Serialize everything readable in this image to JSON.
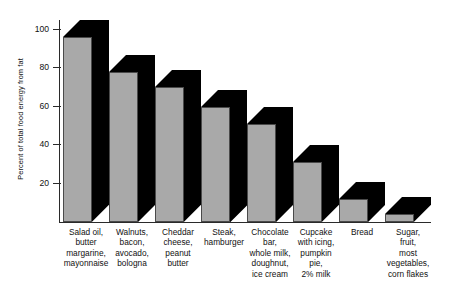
{
  "chart_data": {
    "type": "bar",
    "title": "",
    "xlabel": "",
    "ylabel": "Percent of total food energy from fat",
    "ylim": [
      0,
      105
    ],
    "yticks": [
      20,
      40,
      60,
      80,
      100
    ],
    "ytick_labels": [
      "20",
      "40",
      "60",
      "80",
      "100"
    ],
    "grid": false,
    "legend": "none",
    "style": "3d-shadow-bars",
    "bar_face_color": "#a9a9a9",
    "bar_shadow_color": "#000000",
    "axis_color": "#2a2a2a",
    "background_color": "#ffffff",
    "categories": [
      "Salad oil,\nbutter\nmargarine,\nmayonnaise",
      "Walnuts,\nbacon,\navocado,\nbologna",
      "Cheddar\ncheese,\npeanut\nbutter",
      "Steak,\nhamburger",
      "Chocolate\nbar,\nwhole milk,\ndoughnut,\nice cream",
      "Cupcake\nwith icing,\npumpkin\npie,\n2% milk",
      "Bread",
      "Sugar,\nfruit,\nmost\nvegetables,\ncorn flakes"
    ],
    "values": [
      96,
      78,
      70,
      60,
      51,
      31,
      12,
      4
    ]
  },
  "axis": {
    "y_title": "Percent of total food energy from fat"
  }
}
